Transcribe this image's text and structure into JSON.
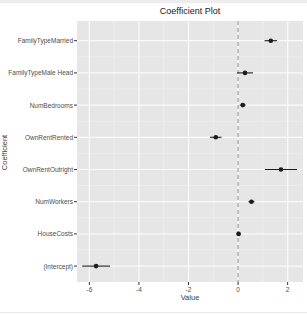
{
  "page": {
    "background": "#ffffff",
    "top_strip_color": "#ededed",
    "bottom_strip_color": "#e9e9e9"
  },
  "chart_data": {
    "type": "scatter",
    "subtype": "coefficient-dot-whisker",
    "title": "Coefficient Plot",
    "xlabel": "Value",
    "ylabel": "Coefficient",
    "categories": [
      "FamilyTypeMarried",
      "FamilyTypeMale Head",
      "NumBedrooms",
      "OwnRentRented",
      "OwnRentOutright",
      "NumWorkers",
      "HouseCosts",
      "(Intercept)"
    ],
    "values": [
      1.32,
      0.28,
      0.19,
      -0.9,
      1.73,
      0.54,
      0.02,
      -5.73
    ],
    "ci_low": [
      1.07,
      -0.04,
      0.07,
      -1.13,
      1.08,
      0.42,
      -0.06,
      -6.29
    ],
    "ci_high": [
      1.57,
      0.6,
      0.31,
      -0.67,
      2.38,
      0.66,
      0.1,
      -5.17
    ],
    "xlim": [
      -6.5,
      2.62
    ],
    "x_ticks": [
      -6,
      -4,
      -2,
      0,
      2
    ],
    "x_minor_ticks": [
      -5,
      -3,
      -1,
      1
    ],
    "vline": {
      "x": 0,
      "style": "dashed",
      "color": "#8c8c8c"
    },
    "grid": "on",
    "legend": "none",
    "colors": {
      "panel_bg": "#e6e6e6",
      "grid_major": "#fafafa",
      "grid_minor": "#efefef",
      "point": "#1c1c1c",
      "tick_mark": "#333333",
      "tick_text": "#4d4d4d",
      "title_text": "#1a1a1a",
      "axis_title_text": "#3c3c3c"
    }
  }
}
